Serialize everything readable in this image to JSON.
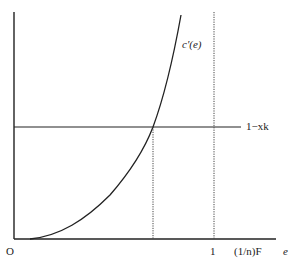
{
  "diagram": {
    "type": "economic-graph",
    "axes": {
      "origin_label": "O",
      "x_axis_label": "e",
      "x_ticks": [
        {
          "label": "1",
          "x": 214
        },
        {
          "label": "(1/n)F",
          "x": 250
        }
      ]
    },
    "curves": [
      {
        "name": "marginal-cost-curve",
        "label": "c′(e)",
        "shape": "convex increasing"
      },
      {
        "name": "horizontal-line",
        "label": "1−xk"
      }
    ],
    "intersection": {
      "x": 153,
      "y": 127,
      "dropline": "dotted"
    },
    "vertical_dotted_at": "1",
    "colors": {
      "line": "#222222",
      "background": "#ffffff"
    }
  }
}
